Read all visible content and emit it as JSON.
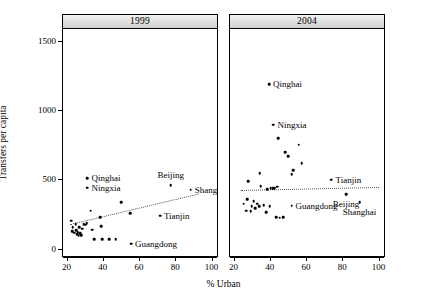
{
  "chart_data": {
    "type": "scatter",
    "title": "",
    "xlabel": "% Urban",
    "ylabel": "Transfers per capita",
    "xlim": [
      18,
      103
    ],
    "ylim": [
      -60,
      1580
    ],
    "xticks": [
      20,
      40,
      60,
      80,
      100
    ],
    "yticks": [
      0,
      500,
      1000,
      1500
    ],
    "grid": false,
    "legend": "none",
    "panel_layout": "1 row x 2 columns (lattice strip panels)",
    "panels": [
      {
        "strip_label": "1999",
        "fit_line": {
          "style": "dotted",
          "x": [
            22,
            93
          ],
          "y": [
            172,
            392
          ]
        },
        "labeled_points": [
          {
            "name": "Qinghai",
            "x": 31.5,
            "y": 500,
            "label_side": "right"
          },
          {
            "name": "Ningxia",
            "x": 31.5,
            "y": 432,
            "label_side": "right"
          },
          {
            "name": "Beijing",
            "x": 77.5,
            "y": 450,
            "label_side": "above"
          },
          {
            "name": "Shanghai",
            "x": 88.5,
            "y": 418,
            "label_side": "right"
          },
          {
            "name": "Tianjin",
            "x": 71.5,
            "y": 232,
            "label_side": "right"
          },
          {
            "name": "Guangdong",
            "x": 55.5,
            "y": 30,
            "label_side": "right"
          }
        ],
        "other_points": [
          {
            "x": 22.5,
            "y": 196
          },
          {
            "x": 23.4,
            "y": 146
          },
          {
            "x": 23.0,
            "y": 120
          },
          {
            "x": 24.2,
            "y": 108
          },
          {
            "x": 25.1,
            "y": 170
          },
          {
            "x": 25.4,
            "y": 128
          },
          {
            "x": 25.8,
            "y": 96
          },
          {
            "x": 26.2,
            "y": 112
          },
          {
            "x": 26.6,
            "y": 88
          },
          {
            "x": 27.0,
            "y": 150
          },
          {
            "x": 27.4,
            "y": 104
          },
          {
            "x": 28.0,
            "y": 92
          },
          {
            "x": 28.6,
            "y": 136
          },
          {
            "x": 29.4,
            "y": 170
          },
          {
            "x": 30.2,
            "y": 166
          },
          {
            "x": 31.0,
            "y": 176
          },
          {
            "x": 33.4,
            "y": 268
          },
          {
            "x": 34.2,
            "y": 130
          },
          {
            "x": 35.2,
            "y": 62
          },
          {
            "x": 38.4,
            "y": 220
          },
          {
            "x": 39.2,
            "y": 156
          },
          {
            "x": 39.6,
            "y": 62
          },
          {
            "x": 43.4,
            "y": 62
          },
          {
            "x": 47.0,
            "y": 62
          },
          {
            "x": 50.2,
            "y": 330
          },
          {
            "x": 55.0,
            "y": 248
          }
        ]
      },
      {
        "strip_label": "2004",
        "fit_line": {
          "style": "dotted",
          "x": [
            24,
            100
          ],
          "y": [
            418,
            440
          ]
        },
        "labeled_points": [
          {
            "name": "Qinghai",
            "x": 39.5,
            "y": 1180,
            "label_side": "right"
          },
          {
            "name": "Ningxia",
            "x": 42.0,
            "y": 890,
            "label_side": "right"
          },
          {
            "name": "Tianjin",
            "x": 74.0,
            "y": 492,
            "label_side": "right"
          },
          {
            "name": "Beijing",
            "x": 82.0,
            "y": 388,
            "label_side": "below"
          },
          {
            "name": "Shanghai",
            "x": 89.5,
            "y": 330,
            "label_side": "below"
          },
          {
            "name": "Guangdong",
            "x": 52.0,
            "y": 302,
            "label_side": "right"
          }
        ],
        "other_points": [
          {
            "x": 44.5,
            "y": 790
          },
          {
            "x": 56.0,
            "y": 745
          },
          {
            "x": 48.5,
            "y": 690
          },
          {
            "x": 50.0,
            "y": 662
          },
          {
            "x": 57.5,
            "y": 612
          },
          {
            "x": 53.0,
            "y": 560
          },
          {
            "x": 52.0,
            "y": 530
          },
          {
            "x": 34.5,
            "y": 540
          },
          {
            "x": 28.0,
            "y": 482
          },
          {
            "x": 35.0,
            "y": 446
          },
          {
            "x": 40.5,
            "y": 430
          },
          {
            "x": 41.5,
            "y": 428
          },
          {
            "x": 42.4,
            "y": 428
          },
          {
            "x": 44.0,
            "y": 440
          },
          {
            "x": 38.6,
            "y": 424
          },
          {
            "x": 27.5,
            "y": 350
          },
          {
            "x": 25.5,
            "y": 318
          },
          {
            "x": 31.0,
            "y": 338
          },
          {
            "x": 30.0,
            "y": 300
          },
          {
            "x": 33.0,
            "y": 318
          },
          {
            "x": 34.0,
            "y": 300
          },
          {
            "x": 32.0,
            "y": 284
          },
          {
            "x": 27.0,
            "y": 268
          },
          {
            "x": 29.5,
            "y": 262
          },
          {
            "x": 36.5,
            "y": 306
          },
          {
            "x": 40.0,
            "y": 300
          },
          {
            "x": 38.0,
            "y": 258
          },
          {
            "x": 43.5,
            "y": 222
          },
          {
            "x": 45.5,
            "y": 218
          },
          {
            "x": 47.5,
            "y": 222
          }
        ]
      }
    ]
  }
}
